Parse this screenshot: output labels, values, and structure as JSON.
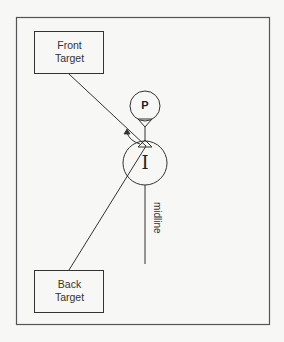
{
  "diagram": {
    "front_target": {
      "line1": "Front",
      "line2": "Target"
    },
    "back_target": {
      "line1": "Back",
      "line2": "Target"
    },
    "top_circle": {
      "label": "P"
    },
    "bottom_circle": {
      "label": "I"
    },
    "midline": {
      "label": "midline"
    },
    "colors": {
      "background": "#f7f7f6",
      "stroke": "#333333",
      "frame": "#555555"
    }
  }
}
